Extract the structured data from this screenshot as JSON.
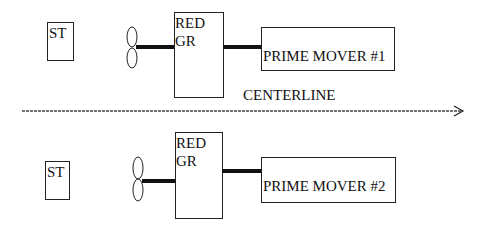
{
  "diagram": {
    "centerline": {
      "label": "CENTERLINE"
    },
    "top_train": {
      "steering": "ST",
      "gear_line1": "RED",
      "gear_line2": "GR",
      "prime_mover": "PRIME MOVER #1"
    },
    "bottom_train": {
      "steering": "ST",
      "gear_line1": "RED",
      "gear_line2": "GR",
      "prime_mover": "PRIME MOVER #2"
    }
  }
}
